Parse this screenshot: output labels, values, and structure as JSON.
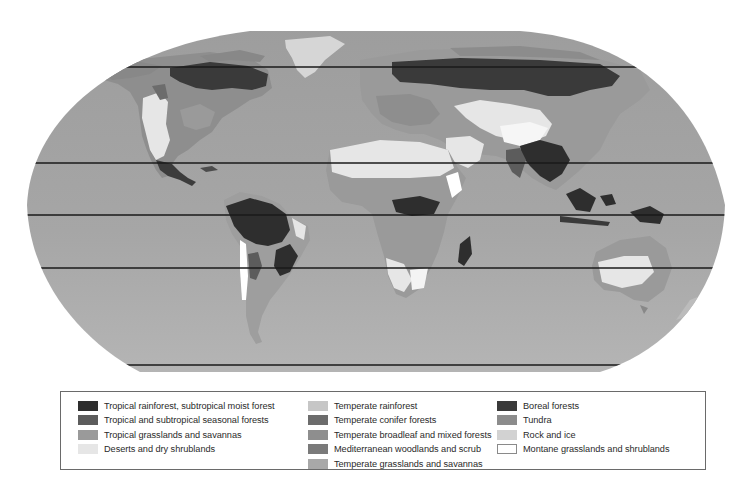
{
  "map": {
    "title": "",
    "projection": "Robinson-style world map",
    "ocean_color": "#a3a3a3",
    "latitude_lines_y": [
      67,
      163,
      215,
      268,
      365
    ],
    "regions": [
      {
        "name": "north-america",
        "label": ""
      },
      {
        "name": "greenland",
        "label": ""
      },
      {
        "name": "south-america",
        "label": ""
      },
      {
        "name": "europe-asia",
        "label": ""
      },
      {
        "name": "africa",
        "label": ""
      },
      {
        "name": "australia",
        "label": ""
      },
      {
        "name": "antarctica-edge",
        "label": ""
      }
    ]
  },
  "legend": {
    "columns": [
      {
        "items": [
          {
            "label": "Tropical rainforest, subtropical moist forest",
            "color": "#2e2e2e"
          },
          {
            "label": "Tropical and subtropical seasonal forests",
            "color": "#5c5c5c"
          },
          {
            "label": "Tropical grasslands and savannas",
            "color": "#9a9a9a"
          },
          {
            "label": "Deserts and dry shrublands",
            "color": "#e6e6e6"
          }
        ]
      },
      {
        "items": [
          {
            "label": "Temperate rainforest",
            "color": "#c6c6c6"
          },
          {
            "label": "Temperate conifer forests",
            "color": "#6c6c6c"
          },
          {
            "label": "Temperate broadleaf and mixed forests",
            "color": "#8e8e8e"
          },
          {
            "label": "Mediterranean woodlands and scrub",
            "color": "#7a7a7a"
          },
          {
            "label": "Temperate grasslands and savannas",
            "color": "#a8a8a8"
          }
        ]
      },
      {
        "items": [
          {
            "label": "Boreal forests",
            "color": "#3a3a3a"
          },
          {
            "label": "Tundra",
            "color": "#8c8c8c"
          },
          {
            "label": "Rock and ice",
            "color": "#d2d2d2"
          },
          {
            "label": "Montane grasslands and shrublands",
            "color": "#ffffff",
            "outlined": true
          }
        ]
      }
    ]
  }
}
